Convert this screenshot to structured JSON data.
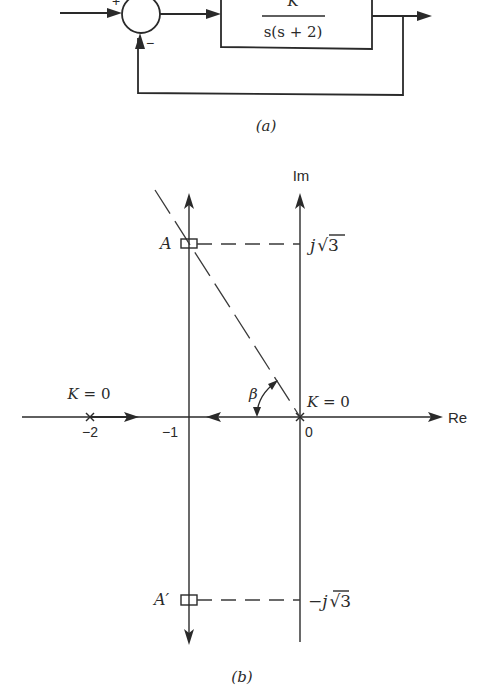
{
  "figure_a": {
    "caption": "(a)",
    "summing_junction": {
      "plus_sign": "+",
      "minus_sign": "−"
    },
    "transfer_function": {
      "numerator": "K",
      "denominator": "s(s + 2)"
    }
  },
  "figure_b": {
    "caption": "(b)",
    "axes": {
      "imag_label": "Im",
      "real_label": "Re"
    },
    "tick_labels": {
      "neg_two": "−2",
      "neg_one": "−1",
      "zero": "0"
    },
    "poles": [
      {
        "label": "K = 0",
        "location": "-2"
      },
      {
        "label": "K = 0",
        "location": "0"
      }
    ],
    "points": {
      "upper": {
        "label": "A",
        "value_label": "j√3",
        "j": "j",
        "radical": "√3"
      },
      "lower": {
        "label": "A′",
        "value_label": "−j√3",
        "j": "−j",
        "radical": "√3"
      }
    },
    "angle_label": "β"
  }
}
